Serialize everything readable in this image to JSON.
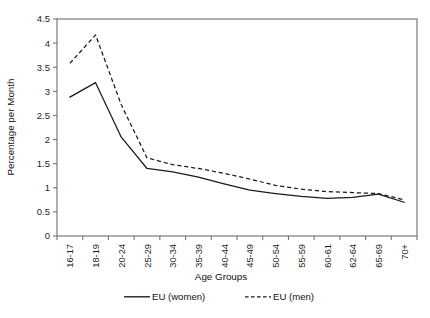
{
  "chart_data": {
    "type": "line",
    "title": "",
    "xlabel": "Age Groups",
    "ylabel": "Percentage per Month",
    "categories": [
      "16-17",
      "18-19",
      "20-24",
      "25-29",
      "30-34",
      "35-39",
      "40-44",
      "45-49",
      "50-54",
      "55-59",
      "60-61",
      "62-64",
      "65-69",
      "70+"
    ],
    "series": [
      {
        "name": "EU (women)",
        "style": "solid",
        "values": [
          2.88,
          3.18,
          2.05,
          1.4,
          1.33,
          1.22,
          1.08,
          0.95,
          0.88,
          0.82,
          0.78,
          0.8,
          0.87,
          0.7
        ]
      },
      {
        "name": "EU (men)",
        "style": "dashed",
        "values": [
          3.58,
          4.17,
          2.72,
          1.62,
          1.48,
          1.4,
          1.3,
          1.18,
          1.05,
          0.97,
          0.92,
          0.9,
          0.88,
          0.75
        ]
      }
    ],
    "ylim": [
      0,
      4.5
    ],
    "yticks": [
      "0",
      "0.5",
      "1",
      "1.5",
      "2",
      "2.5",
      "3",
      "3.5",
      "4",
      "4.5"
    ],
    "ytick_values": [
      0,
      0.5,
      1,
      1.5,
      2,
      2.5,
      3,
      3.5,
      4,
      4.5
    ],
    "grid": false,
    "legend_position": "bottom"
  },
  "legend": {
    "entries": [
      {
        "label": "EU (women)",
        "style": "solid"
      },
      {
        "label": "EU (men)",
        "style": "dashed"
      }
    ]
  }
}
